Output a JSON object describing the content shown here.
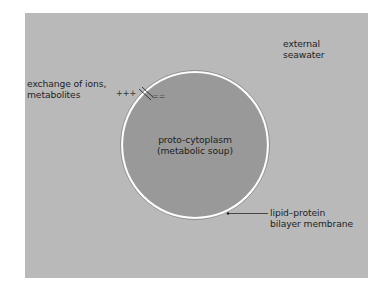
{
  "diagram": {
    "type": "cell-membrane-schematic",
    "colors": {
      "page_background": "#ffffff",
      "panel_background": "#b9b9b9",
      "cytoplasm_fill": "#999999",
      "membrane_ring": "#ffffff",
      "membrane_outline": "#3a3a3a",
      "text": "#1e1e1e"
    },
    "labels": {
      "external": {
        "line1": "external",
        "line2": "seawater"
      },
      "exchange": {
        "line1": "exchange of ions,",
        "line2": "metabolites"
      },
      "cytoplasm": {
        "line1": "proto-cytoplasm",
        "line2": "(metabolic soup)"
      },
      "membrane": {
        "line1": "lipid–protein",
        "line2": "bilayer membrane"
      }
    },
    "charge_symbols": {
      "outside": "+++",
      "inside": "=="
    }
  }
}
